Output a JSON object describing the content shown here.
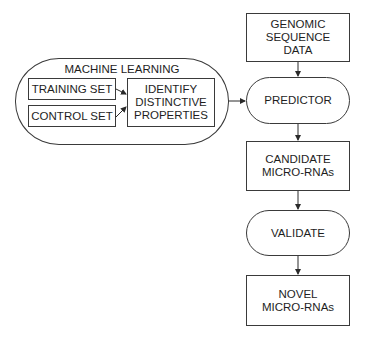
{
  "diagram": {
    "type": "flowchart",
    "group": {
      "title": "MACHINE LEARNING",
      "inputs": [
        {
          "label": "TRAINING SET"
        },
        {
          "label": "CONTROL SET"
        }
      ],
      "process": {
        "label": "IDENTIFY\nDISTINCTIVE\nPROPERTIES"
      }
    },
    "pipeline": [
      {
        "label": "GENOMIC\nSEQUENCE\nDATA",
        "shape": "rectangle"
      },
      {
        "label": "PREDICTOR",
        "shape": "rounded"
      },
      {
        "label": "CANDIDATE\nMICRO-RNAs",
        "shape": "rectangle"
      },
      {
        "label": "VALIDATE",
        "shape": "rounded"
      },
      {
        "label": "NOVEL\nMICRO-RNAs",
        "shape": "rectangle"
      }
    ],
    "edges": [
      {
        "from": "TRAINING SET",
        "to": "IDENTIFY DISTINCTIVE PROPERTIES"
      },
      {
        "from": "CONTROL SET",
        "to": "IDENTIFY DISTINCTIVE PROPERTIES"
      },
      {
        "from": "MACHINE LEARNING",
        "to": "PREDICTOR"
      },
      {
        "from": "GENOMIC SEQUENCE DATA",
        "to": "PREDICTOR"
      },
      {
        "from": "PREDICTOR",
        "to": "CANDIDATE MICRO-RNAs"
      },
      {
        "from": "CANDIDATE MICRO-RNAs",
        "to": "VALIDATE"
      },
      {
        "from": "VALIDATE",
        "to": "NOVEL MICRO-RNAs"
      }
    ],
    "colors": {
      "stroke": "#3a3a3a",
      "text": "#1e1e1e",
      "background": "#ffffff"
    }
  }
}
